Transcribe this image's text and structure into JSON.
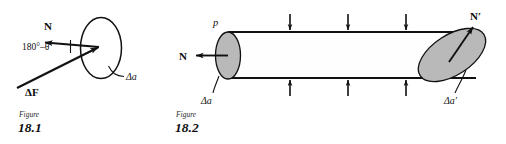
{
  "page": {
    "background_color": "#ffffff",
    "ink_color": "#111111",
    "cap_fill_color": "#b9b9b9"
  },
  "figures": [
    {
      "id": "figure-18-1",
      "caption_word": "Figure",
      "caption_number": "18.1",
      "description": "Force vector delta F striking an area element delta a at an angle of 180 degrees minus theta from the outward normal N",
      "labels": {
        "normal": "N",
        "angle": "180°–θ",
        "force": "ΔF",
        "area": "Δa"
      },
      "elements": {
        "area_ellipse": "open ellipse outline",
        "normal_arrow_direction": "left",
        "force_arrow_direction": "up-right",
        "angle_tick": "short vertical tick between normal and force vectors",
        "area_leader": "curved leader line from ellipse to area label"
      }
    },
    {
      "id": "figure-18-2",
      "caption_word": "Figure",
      "caption_number": "18.2",
      "description": "Flow tube with shaded end caps, inward pressure arrows on the walls, and outward normals at each end",
      "labels": {
        "pressure": "p",
        "normal_left": "N",
        "normal_right": "N′",
        "area_left": "Δa",
        "area_right": "Δa′"
      },
      "elements": {
        "top_pressure_arrows": 3,
        "bottom_pressure_arrows": 3,
        "top_arrow_direction": "down",
        "bottom_arrow_direction": "up",
        "left_cap": "shaded vertical ellipse",
        "right_cap": "shaded tilted ellipse",
        "normal_left_direction": "left",
        "normal_right_direction": "up-right"
      }
    }
  ]
}
